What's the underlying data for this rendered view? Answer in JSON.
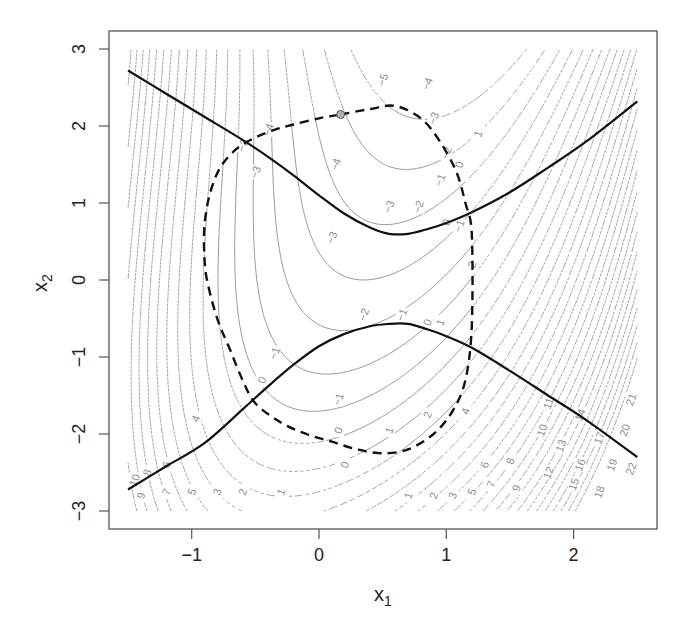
{
  "chart_data": {
    "type": "contour",
    "title": "",
    "xlabel": "x",
    "xlabel_sub": "1",
    "ylabel": "x",
    "ylabel_sub": "2",
    "xlim": [
      -1.5,
      2.5
    ],
    "ylim": [
      -3,
      3
    ],
    "x_ticks": [
      -1,
      0,
      1,
      2
    ],
    "x_tick_labels": [
      "−1",
      "0",
      "1",
      "2"
    ],
    "y_ticks": [
      -3,
      -2,
      -1,
      0,
      1,
      2,
      3
    ],
    "y_tick_labels": [
      "−3",
      "−2",
      "−1",
      "0",
      "1",
      "2",
      "3"
    ],
    "grid": false,
    "legend": null,
    "contour_levels": [
      -5,
      -4,
      -3,
      -2,
      -1,
      0,
      1,
      2,
      3,
      4,
      5,
      6,
      7,
      8,
      9,
      10,
      11,
      12,
      13,
      14,
      15,
      16,
      17,
      18,
      19,
      20,
      21,
      22
    ],
    "contour_styles": {
      "dashed_gray": "contours outside feasible region (dotted/dashed gray)",
      "solid_gray": "contours inside feasible region (solid thin gray)"
    },
    "contour_labels_visible": [
      {
        "value": -5,
        "x": 0.5,
        "y": 2.6
      },
      {
        "value": -4,
        "x": 0.13,
        "y": 1.5
      },
      {
        "value": -4,
        "x": 0.85,
        "y": 2.55
      },
      {
        "value": -4,
        "x": -0.4,
        "y": 1.95
      },
      {
        "value": -3,
        "x": 0.1,
        "y": 0.55
      },
      {
        "value": -3,
        "x": 0.9,
        "y": 2.1
      },
      {
        "value": -3,
        "x": 0.55,
        "y": 0.95
      },
      {
        "value": -3,
        "x": -0.6,
        "y": 1.75
      },
      {
        "value": -3,
        "x": -0.5,
        "y": 1.4
      },
      {
        "value": -2,
        "x": 0.35,
        "y": -0.45
      },
      {
        "value": -2,
        "x": 0.78,
        "y": 0.95
      },
      {
        "value": -2,
        "x": 1.0,
        "y": 1.65
      },
      {
        "value": -1,
        "x": 0.15,
        "y": -1.55
      },
      {
        "value": -1,
        "x": 0.95,
        "y": 1.3
      },
      {
        "value": -1,
        "x": 0.65,
        "y": -0.45
      },
      {
        "value": -1,
        "x": 1.1,
        "y": 0.7
      },
      {
        "value": -1,
        "x": -0.35,
        "y": -0.95
      },
      {
        "value": 0,
        "x": 0.2,
        "y": -2.4
      },
      {
        "value": 0,
        "x": 1.0,
        "y": 0.75
      },
      {
        "value": 0,
        "x": 0.85,
        "y": -0.55
      },
      {
        "value": 0,
        "x": 0.15,
        "y": -1.95
      },
      {
        "value": 0,
        "x": 1.1,
        "y": 1.5
      },
      {
        "value": 0,
        "x": -0.45,
        "y": -1.3
      },
      {
        "value": 1,
        "x": -0.3,
        "y": -2.75
      },
      {
        "value": 1,
        "x": 0.7,
        "y": -2.8
      },
      {
        "value": 1,
        "x": 1.25,
        "y": 1.9
      },
      {
        "value": 1,
        "x": 0.55,
        "y": -1.95
      },
      {
        "value": 1,
        "x": 0.95,
        "y": -0.55
      },
      {
        "value": 2,
        "x": -0.6,
        "y": -2.75
      },
      {
        "value": 2,
        "x": 0.9,
        "y": -2.8
      },
      {
        "value": 2,
        "x": 1.2,
        "y": 0.2
      },
      {
        "value": 2,
        "x": 0.85,
        "y": -1.75
      },
      {
        "value": 3,
        "x": -0.8,
        "y": -2.75
      },
      {
        "value": 3,
        "x": 1.05,
        "y": -2.8
      },
      {
        "value": 4,
        "x": -0.97,
        "y": -1.8
      },
      {
        "value": 4,
        "x": 1.15,
        "y": -1.7
      },
      {
        "value": 5,
        "x": -1.0,
        "y": -2.75
      },
      {
        "value": 5,
        "x": 1.2,
        "y": -2.75
      },
      {
        "value": 6,
        "x": -1.2,
        "y": -2.4
      },
      {
        "value": 6,
        "x": 1.3,
        "y": -2.4
      },
      {
        "value": 7,
        "x": -1.2,
        "y": -2.75
      },
      {
        "value": 7,
        "x": 1.35,
        "y": -2.65
      },
      {
        "value": 8,
        "x": -1.35,
        "y": -2.5
      },
      {
        "value": 8,
        "x": 1.5,
        "y": -2.35
      },
      {
        "value": 9,
        "x": -1.4,
        "y": -2.8
      },
      {
        "value": 9,
        "x": 1.55,
        "y": -2.7
      },
      {
        "value": 10,
        "x": -1.45,
        "y": -2.6
      },
      {
        "value": 10,
        "x": 1.75,
        "y": -1.95
      },
      {
        "value": 11,
        "x": 1.8,
        "y": -1.6
      },
      {
        "value": 12,
        "x": 1.8,
        "y": -2.5
      },
      {
        "value": 13,
        "x": 1.9,
        "y": -2.15
      },
      {
        "value": 14,
        "x": 2.05,
        "y": -1.75
      },
      {
        "value": 15,
        "x": 2.0,
        "y": -2.65
      },
      {
        "value": 16,
        "x": 2.05,
        "y": -2.4
      },
      {
        "value": 17,
        "x": 2.2,
        "y": -2.05
      },
      {
        "value": 18,
        "x": 2.2,
        "y": -2.75
      },
      {
        "value": 19,
        "x": 2.3,
        "y": -2.4
      },
      {
        "value": 20,
        "x": 2.4,
        "y": -1.95
      },
      {
        "value": 21,
        "x": 2.45,
        "y": -1.55
      },
      {
        "value": 22,
        "x": 2.45,
        "y": -2.45
      }
    ],
    "series": [
      {
        "name": "upper boundary curve (solid black)",
        "style": "solid",
        "x": [
          -1.5,
          -1.2,
          -0.9,
          -0.6,
          -0.4,
          -0.2,
          0.0,
          0.2,
          0.4,
          0.55,
          0.7,
          0.85,
          1.0,
          1.2,
          1.5,
          1.8,
          2.1,
          2.5
        ],
        "y": [
          2.72,
          2.42,
          2.12,
          1.82,
          1.6,
          1.36,
          1.1,
          0.86,
          0.68,
          0.6,
          0.6,
          0.66,
          0.74,
          0.88,
          1.14,
          1.46,
          1.8,
          2.32
        ]
      },
      {
        "name": "lower boundary curve (solid black)",
        "style": "solid",
        "x": [
          -1.5,
          -1.2,
          -0.9,
          -0.6,
          -0.4,
          -0.2,
          0.0,
          0.2,
          0.4,
          0.55,
          0.7,
          0.85,
          1.0,
          1.2,
          1.5,
          1.8,
          2.1,
          2.5
        ],
        "y": [
          -2.72,
          -2.42,
          -2.12,
          -1.68,
          -1.38,
          -1.1,
          -0.86,
          -0.7,
          -0.6,
          -0.57,
          -0.57,
          -0.64,
          -0.73,
          -0.88,
          -1.18,
          -1.5,
          -1.82,
          -2.3
        ]
      },
      {
        "name": "closed dashed curve (thick dashed black)",
        "style": "dashed",
        "closed": true,
        "x": [
          0.17,
          0.4,
          0.6,
          0.8,
          0.95,
          1.08,
          1.15,
          1.2,
          1.2,
          1.15,
          1.05,
          0.9,
          0.7,
          0.5,
          0.3,
          0.1,
          -0.1,
          -0.3,
          -0.5,
          -0.6,
          -0.7,
          -0.8,
          -0.88,
          -0.9,
          -0.9,
          -0.86,
          -0.78,
          -0.65,
          -0.5,
          -0.35,
          -0.2,
          0.0,
          0.17
        ],
        "y": [
          2.15,
          2.22,
          2.26,
          2.1,
          1.8,
          1.4,
          1.0,
          0.6,
          -0.6,
          -1.3,
          -1.7,
          -2.0,
          -2.2,
          -2.25,
          -2.2,
          -2.1,
          -2.0,
          -1.85,
          -1.6,
          -1.3,
          -0.9,
          -0.5,
          0.0,
          0.3,
          0.7,
          1.1,
          1.45,
          1.7,
          1.85,
          1.95,
          2.02,
          2.1,
          2.15
        ]
      },
      {
        "name": "marked point",
        "style": "marker",
        "x": [
          0.17
        ],
        "y": [
          2.15
        ],
        "color": "#a0a0a0"
      }
    ]
  },
  "axes": {
    "x_label": "x",
    "x_label_sub": "1",
    "y_label": "x",
    "y_label_sub": "2"
  },
  "colors": {
    "axis": "#555555",
    "contour": "#9a9a9a",
    "curve": "#111111",
    "marker_fill": "#b0b0b0"
  }
}
